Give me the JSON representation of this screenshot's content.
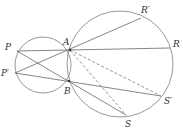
{
  "diagram": {
    "type": "geometry",
    "colors": {
      "stroke": "#8a8a8a",
      "label": "#333333",
      "background": "#ffffff"
    },
    "circles": [
      {
        "name": "small-circle",
        "cx": 43,
        "cy": 65,
        "r": 28
      },
      {
        "name": "large-circle",
        "cx": 120,
        "cy": 64,
        "r": 53
      }
    ],
    "points": {
      "A": {
        "label": "A",
        "x": 70,
        "y": 50,
        "lx": 63,
        "ly": 45
      },
      "B": {
        "label": "B",
        "x": 69,
        "y": 81,
        "lx": 64,
        "ly": 94
      },
      "P": {
        "label": "P",
        "x": 17,
        "y": 51,
        "lx": 5,
        "ly": 50
      },
      "P2": {
        "label": "P′",
        "x": 15,
        "y": 73,
        "lx": 1,
        "ly": 76
      },
      "R": {
        "label": "R",
        "x": 170,
        "y": 48,
        "lx": 173,
        "ly": 47
      },
      "R2": {
        "label": "R′",
        "x": 141,
        "y": 18,
        "lx": 141,
        "ly": 13
      },
      "S": {
        "label": "S",
        "x": 126,
        "y": 115,
        "lx": 125,
        "ly": 127
      },
      "S2": {
        "label": "S′",
        "x": 161,
        "y": 96,
        "lx": 164,
        "ly": 104
      }
    },
    "segments": [
      {
        "from": "P",
        "to": "R",
        "style": "solid"
      },
      {
        "from": "P2",
        "to": "R2",
        "style": "solid"
      },
      {
        "from": "P",
        "to": "S",
        "style": "solid"
      },
      {
        "from": "P2",
        "to": "S2",
        "style": "solid"
      },
      {
        "from": "A",
        "to": "S2",
        "style": "dashed"
      },
      {
        "from": "A",
        "to": "S",
        "style": "dashed"
      }
    ]
  }
}
